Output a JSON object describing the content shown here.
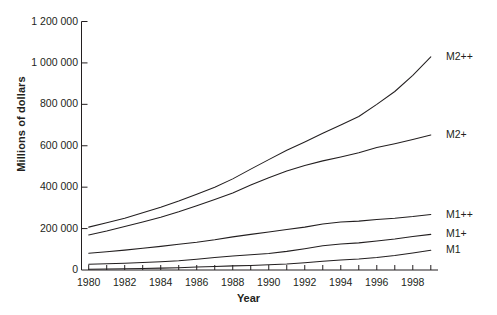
{
  "chart_data": {
    "type": "line",
    "title": "",
    "xlabel": "Year",
    "ylabel": "Millions of dollars",
    "xlim": [
      1979.6,
      1999.4
    ],
    "ylim": [
      0,
      1200000
    ],
    "grid": false,
    "legend_position": "right-of-plot (inline series labels)",
    "ytick_labels": [
      "1 200 000",
      "1 000 000",
      "800 000",
      "600 000",
      "400 000",
      "200 000",
      "0"
    ],
    "ytick_values": [
      1200000,
      1000000,
      800000,
      600000,
      400000,
      200000,
      0
    ],
    "xtick_labels": [
      "1980",
      "1982",
      "1984",
      "1986",
      "1988",
      "1990",
      "1992",
      "1994",
      "1996",
      "1998"
    ],
    "xtick_values": [
      1980,
      1982,
      1984,
      1986,
      1988,
      1990,
      1992,
      1994,
      1996,
      1998
    ],
    "x": [
      1980,
      1981,
      1982,
      1983,
      1984,
      1985,
      1986,
      1987,
      1988,
      1989,
      1990,
      1991,
      1992,
      1993,
      1994,
      1995,
      1996,
      1997,
      1998,
      1999
    ],
    "series": [
      {
        "name": "M2++",
        "label": "M2++",
        "values": [
          207000,
          228000,
          250000,
          276000,
          303000,
          333000,
          366000,
          400000,
          440000,
          487000,
          533000,
          578000,
          618000,
          660000,
          700000,
          741000,
          800000,
          862000,
          940000,
          1029000
        ]
      },
      {
        "name": "M2+",
        "label": "M2+",
        "values": [
          169000,
          188000,
          210000,
          232000,
          255000,
          281000,
          310000,
          340000,
          372000,
          410000,
          446000,
          478000,
          505000,
          527000,
          546000,
          566000,
          592000,
          610000,
          630000,
          652000
        ]
      },
      {
        "name": "M1++",
        "label": "M1++",
        "values": [
          81000,
          88000,
          96000,
          105000,
          114000,
          124000,
          134000,
          146000,
          160000,
          172000,
          184000,
          196000,
          207000,
          222000,
          232000,
          236000,
          244000,
          250000,
          258000,
          268000
        ]
      },
      {
        "name": "M1+",
        "label": "M1+",
        "values": [
          28000,
          30000,
          33000,
          36000,
          40000,
          45000,
          52000,
          60000,
          68000,
          74000,
          80000,
          90000,
          103000,
          117000,
          126000,
          131000,
          140000,
          150000,
          162000,
          172000
        ]
      },
      {
        "name": "M1",
        "label": "M1",
        "values": [
          4000,
          5000,
          6000,
          7000,
          9000,
          11000,
          14000,
          17000,
          20000,
          22000,
          25000,
          29000,
          35000,
          42000,
          48000,
          53000,
          60000,
          70000,
          82000,
          95000
        ]
      }
    ]
  },
  "axes": {
    "y_title": "Millions of dollars",
    "x_title": "Year"
  },
  "colors": {
    "line": "#231f20",
    "axis": "#231f20",
    "background": "#ffffff"
  }
}
